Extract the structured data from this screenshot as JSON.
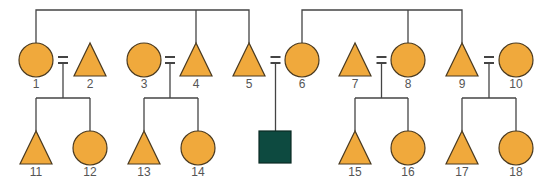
{
  "diagram": {
    "type": "pedigree",
    "colors": {
      "unaffected_fill": "#f0a93c",
      "affected_fill": "#0d4a40",
      "line": "#444444"
    },
    "generation2": [
      {
        "id": "1",
        "shape": "circle"
      },
      {
        "id": "2",
        "shape": "triangle"
      },
      {
        "id": "3",
        "shape": "circle"
      },
      {
        "id": "4",
        "shape": "triangle"
      },
      {
        "id": "5",
        "shape": "triangle"
      },
      {
        "id": "6",
        "shape": "circle"
      },
      {
        "id": "7",
        "shape": "triangle"
      },
      {
        "id": "8",
        "shape": "circle"
      },
      {
        "id": "9",
        "shape": "triangle"
      },
      {
        "id": "10",
        "shape": "circle"
      }
    ],
    "sibships_top": [
      {
        "members": [
          "1",
          "4",
          "5"
        ]
      },
      {
        "members": [
          "6",
          "8",
          "9"
        ]
      }
    ],
    "matings": [
      {
        "partners": [
          "1",
          "2"
        ],
        "children": [
          "11",
          "12"
        ]
      },
      {
        "partners": [
          "3",
          "4"
        ],
        "children": [
          "13",
          "14"
        ]
      },
      {
        "partners": [
          "5",
          "6"
        ],
        "children": [
          "affected"
        ]
      },
      {
        "partners": [
          "7",
          "8"
        ],
        "children": [
          "15",
          "16"
        ]
      },
      {
        "partners": [
          "9",
          "10"
        ],
        "children": [
          "17",
          "18"
        ]
      }
    ],
    "generation3": [
      {
        "id": "11",
        "shape": "triangle"
      },
      {
        "id": "12",
        "shape": "circle"
      },
      {
        "id": "13",
        "shape": "triangle"
      },
      {
        "id": "14",
        "shape": "circle"
      },
      {
        "id": "",
        "shape": "square",
        "affected": true
      },
      {
        "id": "15",
        "shape": "triangle"
      },
      {
        "id": "16",
        "shape": "circle"
      },
      {
        "id": "17",
        "shape": "triangle"
      },
      {
        "id": "18",
        "shape": "circle"
      }
    ]
  }
}
